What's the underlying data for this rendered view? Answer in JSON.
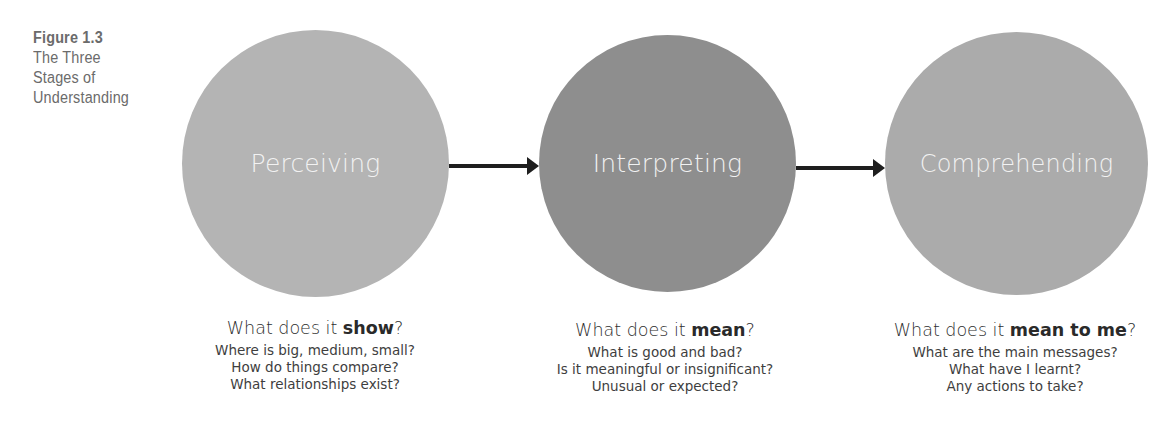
{
  "figure": {
    "label": "Figure 1.3",
    "title_lines": [
      "The Three",
      "Stages of",
      "Understanding"
    ]
  },
  "stages": [
    {
      "name": "Perceiving",
      "color": "#b4b4b4",
      "question_prefix": "What does it ",
      "question_bold": "show",
      "question_suffix": "?",
      "details": [
        "Where is big, medium, small?",
        "How do things compare?",
        "What relationships exist?"
      ]
    },
    {
      "name": "Interpreting",
      "color": "#8e8e8e",
      "question_prefix": "What does it ",
      "question_bold": "mean",
      "question_suffix": "?",
      "details": [
        "What is good and bad?",
        "Is it meaningful or insignificant?",
        "Unusual or expected?"
      ]
    },
    {
      "name": "Comprehending",
      "color": "#ababab",
      "question_prefix": "What does it ",
      "question_bold": "mean to me",
      "question_suffix": "?",
      "details": [
        "What are the main messages?",
        "What have I learnt?",
        "Any actions to take?"
      ]
    }
  ],
  "arrows": [
    {
      "from": "Perceiving",
      "to": "Interpreting"
    },
    {
      "from": "Interpreting",
      "to": "Comprehending"
    }
  ]
}
